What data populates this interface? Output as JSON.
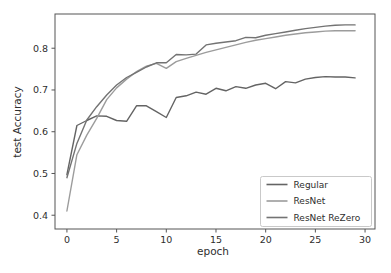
{
  "chart_data": {
    "type": "line",
    "title": "",
    "xlabel": "epoch",
    "ylabel": "test Accuracy",
    "x": [
      0,
      1,
      2,
      3,
      4,
      5,
      6,
      7,
      8,
      9,
      10,
      11,
      12,
      13,
      14,
      15,
      16,
      17,
      18,
      19,
      20,
      21,
      22,
      23,
      24,
      25,
      26,
      27,
      28,
      29
    ],
    "xticks": [
      0,
      5,
      10,
      15,
      20,
      25,
      30
    ],
    "yticks": [
      0.4,
      0.5,
      0.6,
      0.7,
      0.8
    ],
    "xlim": [
      -1.2,
      31.0
    ],
    "ylim": [
      0.367,
      0.882
    ],
    "grid": false,
    "legend_position": "lower right",
    "axis_color": "#555555",
    "series": [
      {
        "name": "Regular",
        "color": "#646464",
        "values": [
          0.497,
          0.615,
          0.627,
          0.638,
          0.637,
          0.627,
          0.625,
          0.662,
          0.662,
          0.648,
          0.634,
          0.682,
          0.686,
          0.695,
          0.69,
          0.704,
          0.698,
          0.708,
          0.704,
          0.712,
          0.716,
          0.703,
          0.72,
          0.717,
          0.726,
          0.73,
          0.732,
          0.731,
          0.731,
          0.729
        ]
      },
      {
        "name": "ResNet",
        "color": "#9c9c9c",
        "values": [
          0.41,
          0.545,
          0.592,
          0.632,
          0.677,
          0.705,
          0.726,
          0.744,
          0.757,
          0.764,
          0.752,
          0.768,
          0.776,
          0.783,
          0.79,
          0.796,
          0.802,
          0.808,
          0.814,
          0.819,
          0.823,
          0.827,
          0.831,
          0.834,
          0.837,
          0.839,
          0.841,
          0.842,
          0.842,
          0.842
        ]
      },
      {
        "name": "ResNet ReZero",
        "color": "#737373",
        "values": [
          0.49,
          0.572,
          0.628,
          0.66,
          0.688,
          0.712,
          0.73,
          0.742,
          0.755,
          0.765,
          0.765,
          0.785,
          0.784,
          0.786,
          0.808,
          0.812,
          0.815,
          0.818,
          0.826,
          0.825,
          0.831,
          0.835,
          0.839,
          0.843,
          0.847,
          0.85,
          0.853,
          0.855,
          0.856,
          0.856
        ]
      }
    ]
  }
}
